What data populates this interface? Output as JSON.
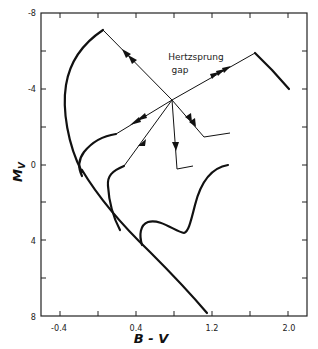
{
  "figure": {
    "type": "Hertzsprung-Russell color-magnitude diagram (evolutionary tracks)",
    "annotation": {
      "line1": "Hertzsprung",
      "line2": "gap"
    }
  },
  "x_axis": {
    "title": "B - V",
    "range": [
      -0.6,
      2.2
    ],
    "tick_labels": [
      "-0.4",
      "0.4",
      "1.2",
      "2.0"
    ],
    "ticks": [
      -0.4,
      0.0,
      0.4,
      0.8,
      1.2,
      1.6,
      2.0
    ]
  },
  "y_axis": {
    "title": "M_V",
    "title_main": "M",
    "title_sub": "V",
    "range": [
      -8,
      8
    ],
    "inverted": true,
    "tick_labels": [
      "-8",
      "-4",
      "0",
      "4",
      "8"
    ],
    "ticks": [
      -8,
      -6,
      -4,
      -2,
      0,
      2,
      4,
      6,
      8
    ]
  },
  "colors": {
    "ink": "#111111",
    "background": "#ffffff"
  }
}
